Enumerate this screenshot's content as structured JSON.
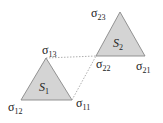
{
  "diagram": {
    "colors": {
      "fill": "#d4d4d4",
      "stroke": "#888888",
      "dotted": "#999999"
    },
    "triangles": [
      {
        "name": "S",
        "sub": "1",
        "points": "46,58 21,100 72,100"
      },
      {
        "name": "S",
        "sub": "2",
        "points": "120,12 96,56 145,56"
      }
    ],
    "labels": {
      "s13": {
        "base": "σ",
        "sub": "13"
      },
      "s12": {
        "base": "σ",
        "sub": "12"
      },
      "s11": {
        "base": "σ",
        "sub": "11"
      },
      "s23": {
        "base": "σ",
        "sub": "23"
      },
      "s22": {
        "base": "σ",
        "sub": "22"
      },
      "s21": {
        "base": "σ",
        "sub": "21"
      }
    }
  }
}
